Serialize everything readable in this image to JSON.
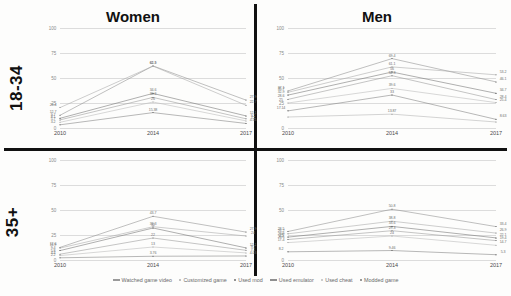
{
  "figure": {
    "row_labels": [
      "18-34",
      "35+"
    ],
    "column_titles": [
      "Women",
      "Men"
    ]
  },
  "legend": {
    "position": "bottom",
    "items": [
      {
        "label": "Watched game video",
        "color": "#9a9a9a",
        "marker": "line"
      },
      {
        "label": "Customized game",
        "color": "#adadad",
        "marker": "dot"
      },
      {
        "label": "Used mod",
        "color": "#6e6e6e",
        "marker": "dot"
      },
      {
        "label": "Used emulator",
        "color": "#8f8f8f",
        "marker": "line"
      },
      {
        "label": "Used cheat",
        "color": "#bdbdbd",
        "marker": "dot"
      },
      {
        "label": "Modded game",
        "color": "#777777",
        "marker": "dot"
      }
    ]
  },
  "chart_data": [
    {
      "type": "line",
      "title": "Women",
      "panel": "18-34",
      "xlabel": "",
      "ylabel": "",
      "x": [
        "2010",
        "2014",
        "2017"
      ],
      "ylim": [
        0,
        100
      ],
      "yticks": [
        0,
        25,
        50,
        75,
        100
      ],
      "grid": true,
      "series": [
        {
          "name": "Watched game video",
          "color": "#8c8c8c",
          "values": [
            12.7,
            62.1,
            27.9
          ]
        },
        {
          "name": "Customized game",
          "color": "#a5a5a5",
          "values": [
            20.4,
            61.9,
            22.7
          ]
        },
        {
          "name": "Used mod",
          "color": "#6e6e6e",
          "values": [
            9.7,
            34.6,
            12.1
          ]
        },
        {
          "name": "Used emulator",
          "color": "#949494",
          "values": [
            8.1,
            30.6,
            9.2
          ]
        },
        {
          "name": "Used cheat",
          "color": "#b8b8b8",
          "values": [
            5.7,
            26.0,
            7.1
          ]
        },
        {
          "name": "Modded game",
          "color": "#7d7d7d",
          "values": [
            3.2,
            15.38,
            4.55
          ]
        }
      ],
      "point_labels": [
        [
          "12.7",
          "62.1",
          "27.9"
        ],
        [
          "20.4",
          "61.9",
          "22.7"
        ],
        [
          "9.7",
          "34.6",
          "12.1"
        ],
        [
          "8.1",
          "30.6",
          "9.2"
        ],
        [
          "5.7",
          "26",
          "7.1"
        ],
        [
          "3.2",
          "15.38",
          "4.55"
        ]
      ]
    },
    {
      "type": "line",
      "title": "Men",
      "panel": "18-34",
      "xlabel": "",
      "ylabel": "",
      "x": [
        "2010",
        "2014",
        "2017"
      ],
      "ylim": [
        0,
        100
      ],
      "yticks": [
        0,
        25,
        50,
        75,
        100
      ],
      "grid": true,
      "series": [
        {
          "name": "Watched game video",
          "color": "#8c8c8c",
          "values": [
            37.1,
            69.4,
            46.1
          ]
        },
        {
          "name": "Customized game",
          "color": "#a5a5a5",
          "values": [
            35.7,
            61.1,
            53.2
          ]
        },
        {
          "name": "Used mod",
          "color": "#6e6e6e",
          "values": [
            32.9,
            56.0,
            34.7
          ]
        },
        {
          "name": "Used emulator",
          "color": "#949494",
          "values": [
            28.6,
            52.3,
            28.4
          ]
        },
        {
          "name": "Used cheat",
          "color": "#b8b8b8",
          "values": [
            25.0,
            39.6,
            25.4
          ]
        },
        {
          "name": "Modded game",
          "color": "#7d7d7d",
          "values": [
            17.14,
            33.0,
            8.63
          ]
        },
        {
          "name": "Modded game b",
          "color": "#b0b0b0",
          "values": [
            11.0,
            13.87,
            6.0
          ]
        }
      ],
      "point_labels": [
        [
          "37.1",
          "69.4",
          "46.1"
        ],
        [
          "35.7",
          "61.1",
          "53.2"
        ],
        [
          "32.9",
          "56",
          "34.7"
        ],
        [
          "28.6",
          "52.3",
          "28.4"
        ],
        [
          "25",
          "39.6",
          "25.4"
        ],
        [
          "17.14",
          "33",
          "8.63"
        ],
        [
          "",
          "13.87",
          ""
        ]
      ]
    },
    {
      "type": "line",
      "title": "Women",
      "panel": "35+",
      "xlabel": "",
      "ylabel": "",
      "x": [
        "2010",
        "2014",
        "2017"
      ],
      "ylim": [
        0,
        100
      ],
      "yticks": [
        0,
        25,
        50,
        75,
        100
      ],
      "grid": true,
      "series": [
        {
          "name": "Watched game video",
          "color": "#8c8c8c",
          "values": [
            12.6,
            43.7,
            27.9
          ]
        },
        {
          "name": "Customized game",
          "color": "#a5a5a5",
          "values": [
            11.9,
            33.3,
            24.0
          ]
        },
        {
          "name": "Used mod",
          "color": "#6e6e6e",
          "values": [
            9.4,
            32.0,
            12.1
          ]
        },
        {
          "name": "Used emulator",
          "color": "#949494",
          "values": [
            5.8,
            22.0,
            9.7
          ]
        },
        {
          "name": "Used cheat",
          "color": "#b8b8b8",
          "values": [
            4.4,
            13.0,
            7.1
          ]
        },
        {
          "name": "Modded game",
          "color": "#7d7d7d",
          "values": [
            2.2,
            3.76,
            4.03
          ]
        }
      ],
      "point_labels": [
        [
          "12.6",
          "43.7",
          "27.9"
        ],
        [
          "11.9",
          "33.3",
          "24"
        ],
        [
          "9.4",
          "32",
          "12.1"
        ],
        [
          "5.8",
          "22",
          "9.7"
        ],
        [
          "4.4",
          "13",
          "7.1"
        ],
        [
          "2.2",
          "3.76",
          "4.03"
        ]
      ]
    },
    {
      "type": "line",
      "title": "Men",
      "panel": "35+",
      "xlabel": "",
      "ylabel": "",
      "x": [
        "2010",
        "2014",
        "2017"
      ],
      "ylim": [
        0,
        100
      ],
      "yticks": [
        0,
        25,
        50,
        75,
        100
      ],
      "grid": true,
      "series": [
        {
          "name": "Watched game video",
          "color": "#8c8c8c",
          "values": [
            28.5,
            50.8,
            33.4
          ]
        },
        {
          "name": "Customized game",
          "color": "#a5a5a5",
          "values": [
            26.2,
            38.8,
            26.9
          ]
        },
        {
          "name": "Used mod",
          "color": "#6e6e6e",
          "values": [
            22.9,
            33.6,
            22.1
          ]
        },
        {
          "name": "Used emulator",
          "color": "#949494",
          "values": [
            20.5,
            29.3,
            19.4
          ]
        },
        {
          "name": "Used cheat",
          "color": "#b8b8b8",
          "values": [
            17.4,
            24.0,
            14.7
          ]
        },
        {
          "name": "Modded game",
          "color": "#7d7d7d",
          "values": [
            8.2,
            9.46,
            5.3
          ]
        }
      ],
      "point_labels": [
        [
          "28.5",
          "50.8",
          "33.4"
        ],
        [
          "26.2",
          "38.8",
          "26.9"
        ],
        [
          "22.9",
          "33.6",
          "22.1"
        ],
        [
          "20.5",
          "29.3",
          "19.4"
        ],
        [
          "17.4",
          "24",
          "14.7"
        ],
        [
          "8.2",
          "9.46",
          "5.3"
        ]
      ]
    }
  ]
}
